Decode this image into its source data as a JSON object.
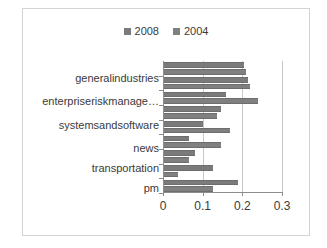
{
  "chart_data": {
    "type": "bar",
    "orientation": "horizontal",
    "title": "",
    "xlabel": "",
    "ylabel": "",
    "xlim": [
      0,
      0.3
    ],
    "xticks": [
      "0",
      "0.1",
      "0.2",
      "0.3"
    ],
    "xtick_values": [
      0,
      0.1,
      0.2,
      0.3
    ],
    "grid": true,
    "legend_position": "top-center",
    "categories": [
      "generalindustries",
      "",
      "enterpriseriskmanage…",
      "",
      "systemsandsoftware",
      "",
      "news",
      "",
      "transportation",
      "",
      "pm"
    ],
    "visible_category_labels": [
      "generalindustries",
      "enterpriseriskmanage…",
      "systemsandsoftware",
      "news",
      "transportation",
      "pm"
    ],
    "series": [
      {
        "name": "2008",
        "color": "#7b7b7b",
        "values": [
          0.205,
          0.215,
          0.16,
          0.145,
          0.1,
          0.065,
          0.08,
          0.125,
          0.038,
          0.125,
          0.002
        ]
      },
      {
        "name": "2004",
        "color": "#808080",
        "values": [
          0.21,
          0.22,
          0.24,
          0.135,
          0.17,
          0.145,
          0.065,
          0.0,
          0.19,
          0.0,
          0.0
        ]
      }
    ],
    "bar_rows": [
      {
        "category": "generalindustries",
        "series_2008": 0.205,
        "series_2004": 0.21
      },
      {
        "category": "",
        "series_2008": 0.215,
        "series_2004": 0.22
      },
      {
        "category": "enterpriseriskmanage…",
        "series_2008": 0.16,
        "series_2004": 0.24
      },
      {
        "category": "",
        "series_2008": 0.145,
        "series_2004": 0.135
      },
      {
        "category": "systemsandsoftware",
        "series_2008": 0.1,
        "series_2004": 0.17
      },
      {
        "category": "",
        "series_2008": 0.065,
        "series_2004": 0.145
      },
      {
        "category": "news",
        "series_2008": 0.08,
        "series_2004": 0.065
      },
      {
        "category": "transportation",
        "series_2008": 0.125,
        "series_2004": 0.038
      },
      {
        "category": "pm",
        "series_2008": 0.19,
        "series_2004": 0.125
      }
    ]
  },
  "legend": {
    "entries": [
      {
        "label": "2008",
        "color": "#7b7b7b"
      },
      {
        "label": "2004",
        "color": "#808080"
      }
    ]
  },
  "axis": {
    "x_tick_labels": [
      "0",
      "0.1",
      "0.2",
      "0.3"
    ]
  },
  "categories_display": [
    "generalindustries",
    "enterpriseriskmanage…",
    "systemsandsoftware",
    "news",
    "transportation",
    "pm"
  ],
  "colors": {
    "series_2008": "#7b7b7b",
    "series_2004": "#808080",
    "gridline": "#c8c8c8",
    "axis": "#8c8c8c",
    "border": "#d3d3d3",
    "text": "#3a3a3a",
    "background": "#ffffff"
  }
}
